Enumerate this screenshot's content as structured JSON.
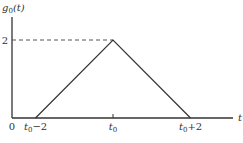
{
  "chart_data": {
    "type": "line",
    "title": "",
    "ylabel": "g0(t)",
    "ylabel_parts": {
      "base": "g",
      "sub": "0",
      "arg": "(t)"
    },
    "xlabel": "t",
    "origin_label": "0",
    "y_ticks": [
      {
        "value": 2,
        "label": "2"
      }
    ],
    "x_ticks": [
      {
        "value": -2,
        "label": "t0−2",
        "base": "t",
        "sub": "0",
        "suffix": "−2"
      },
      {
        "value": 0,
        "label": "t0",
        "base": "t",
        "sub": "0",
        "suffix": ""
      },
      {
        "value": 2,
        "label": "t0+2",
        "base": "t",
        "sub": "0",
        "suffix": "+2"
      }
    ],
    "x_units": "relative to t0",
    "xlim": [
      -3,
      3.6
    ],
    "ylim": [
      0,
      2.6
    ],
    "series": [
      {
        "name": "g0(t)",
        "points": [
          [
            -2,
            0
          ],
          [
            0,
            2
          ],
          [
            2,
            0
          ]
        ]
      }
    ],
    "reference_lines": [
      {
        "type": "horizontal-dashed",
        "y": 2,
        "from_x": "axis",
        "to_x": 0
      }
    ],
    "grid": false,
    "legend": "none"
  },
  "caption": {
    "visible": "partial",
    "text": ""
  }
}
